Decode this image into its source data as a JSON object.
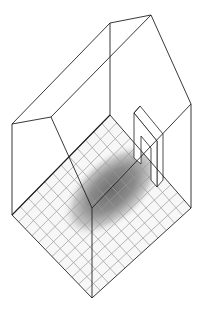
{
  "diagram": {
    "type": "isometric-room-illustration",
    "colors": {
      "background": "#ffffff",
      "line": "#222222",
      "grid": "#9a9a9a",
      "shade_dark": "#7a7a7a",
      "shade_light": "#e6e6e6"
    },
    "floor_grid": {
      "rows": 12,
      "cols": 12
    }
  }
}
